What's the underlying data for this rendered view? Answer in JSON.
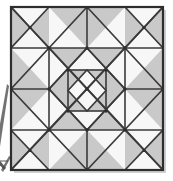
{
  "figure": {
    "type": "quilt-block-diagram",
    "caption": "",
    "canvas": {
      "width": 173,
      "height": 181
    },
    "background_color": "#ffffff"
  },
  "palette": {
    "background": "#ffffff",
    "gray_fill": "#c9c9c9",
    "gray_fill_light": "#d4d4d4",
    "white_fill": "#f7f7f7",
    "line_color": "#3a3a3a",
    "frame_color": "#2e2e2e",
    "shadow_color": "#9a9a9a"
  },
  "block": {
    "name": "main-quilt-block",
    "frame": {
      "x": 11,
      "y": 7,
      "width": 152,
      "height": 163
    },
    "grid_columns": 4,
    "grid_rows": 4,
    "line_width": 1.6,
    "frame_line_width": 2.2,
    "symmetry": "4-fold (horizontal and vertical mirror)",
    "center_motif": {
      "name": "center-square-with-diamond",
      "x": 68,
      "y": 70,
      "width": 38,
      "height": 41,
      "description": "Small square containing an inscribed diamond, quartered by diagonals"
    }
  },
  "cells": [
    {
      "row": 0,
      "col": 0,
      "name": "cell-r0c0",
      "unit": "hourglass-x",
      "fills": [
        "gray",
        "white",
        "gray",
        "white"
      ]
    },
    {
      "row": 0,
      "col": 1,
      "name": "cell-r0c1",
      "unit": "half-square-triangle",
      "fills": [
        "gray",
        "white"
      ]
    },
    {
      "row": 0,
      "col": 2,
      "name": "cell-r0c2",
      "unit": "half-square-triangle",
      "fills": [
        "white",
        "gray"
      ]
    },
    {
      "row": 0,
      "col": 3,
      "name": "cell-r0c3",
      "unit": "hourglass-x",
      "fills": [
        "gray",
        "white",
        "gray",
        "white"
      ]
    },
    {
      "row": 1,
      "col": 0,
      "name": "cell-r1c0",
      "unit": "half-square-triangle",
      "fills": [
        "white",
        "gray"
      ]
    },
    {
      "row": 1,
      "col": 1,
      "name": "cell-r1c1",
      "unit": "quarter-square",
      "fills": [
        "gray",
        "white",
        "gray",
        "white"
      ]
    },
    {
      "row": 1,
      "col": 2,
      "name": "cell-r1c2",
      "unit": "quarter-square",
      "fills": [
        "white",
        "gray",
        "white",
        "gray"
      ]
    },
    {
      "row": 1,
      "col": 3,
      "name": "cell-r1c3",
      "unit": "half-square-triangle",
      "fills": [
        "gray",
        "white"
      ]
    },
    {
      "row": 2,
      "col": 0,
      "name": "cell-r2c0",
      "unit": "half-square-triangle",
      "fills": [
        "white",
        "gray"
      ]
    },
    {
      "row": 2,
      "col": 1,
      "name": "cell-r2c1",
      "unit": "quarter-square",
      "fills": [
        "gray",
        "white",
        "gray",
        "white"
      ]
    },
    {
      "row": 2,
      "col": 2,
      "name": "cell-r2c2",
      "unit": "quarter-square",
      "fills": [
        "white",
        "gray",
        "white",
        "gray"
      ]
    },
    {
      "row": 2,
      "col": 3,
      "name": "cell-r2c3",
      "unit": "half-square-triangle",
      "fills": [
        "gray",
        "white"
      ]
    },
    {
      "row": 3,
      "col": 0,
      "name": "cell-r3c0",
      "unit": "hourglass-x",
      "fills": [
        "gray",
        "white",
        "gray",
        "white"
      ]
    },
    {
      "row": 3,
      "col": 1,
      "name": "cell-r3c1",
      "unit": "half-square-triangle",
      "fills": [
        "gray",
        "white"
      ]
    },
    {
      "row": 3,
      "col": 2,
      "name": "cell-r3c2",
      "unit": "half-square-triangle",
      "fills": [
        "white",
        "gray"
      ]
    },
    {
      "row": 3,
      "col": 3,
      "name": "cell-r3c3",
      "unit": "hourglass-x",
      "fills": [
        "gray",
        "white",
        "gray",
        "white"
      ]
    }
  ],
  "side_fragment": {
    "name": "cropped-neighbor-figure",
    "description": "Partial triangular outline of an adjacent figure, clipped at the left edge",
    "visible": true
  }
}
